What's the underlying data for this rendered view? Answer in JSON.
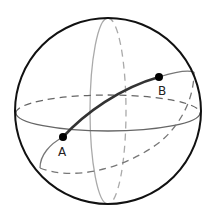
{
  "diagram": {
    "type": "sphere-great-circle",
    "points": [
      {
        "id": "A",
        "label": "A",
        "x": 63,
        "y": 137,
        "label_x": 60,
        "label_y": 155
      },
      {
        "id": "B",
        "label": "B",
        "x": 159,
        "y": 77,
        "label_x": 159,
        "label_y": 95
      }
    ],
    "colors": {
      "sphere_outline": "#111111",
      "equator": "#666666",
      "meridian": "#aaaaaa",
      "tilted_circle": "#777777",
      "geodesic_arc": "#333333",
      "points": "#000000"
    }
  }
}
